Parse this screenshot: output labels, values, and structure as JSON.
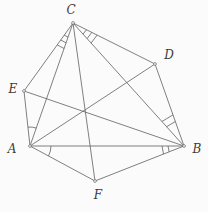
{
  "figure": {
    "background": "#fbfbfb",
    "stroke_color": "#606060",
    "label_color": "#3c3c3c",
    "stroke_width": 0.8,
    "dot_radius": 1.4,
    "points": {
      "A": {
        "x": 30,
        "y": 146,
        "label": "A",
        "label_x": 12,
        "label_y": 149
      },
      "B": {
        "x": 184,
        "y": 146,
        "label": "B",
        "label_x": 197,
        "label_y": 149
      },
      "C": {
        "x": 73,
        "y": 23,
        "label": "C",
        "label_x": 71,
        "label_y": 10
      },
      "D": {
        "x": 155,
        "y": 64,
        "label": "D",
        "label_x": 169,
        "label_y": 55
      },
      "E": {
        "x": 24,
        "y": 91,
        "label": "E",
        "label_x": 13,
        "label_y": 89
      },
      "F": {
        "x": 95,
        "y": 181,
        "label": "F",
        "label_x": 98,
        "label_y": 195
      }
    },
    "segments": [
      [
        "E",
        "C"
      ],
      [
        "C",
        "D"
      ],
      [
        "D",
        "B"
      ],
      [
        "B",
        "F"
      ],
      [
        "F",
        "A"
      ],
      [
        "A",
        "E"
      ],
      [
        "A",
        "B"
      ],
      [
        "B",
        "C"
      ],
      [
        "C",
        "A"
      ],
      [
        "A",
        "D"
      ],
      [
        "B",
        "E"
      ],
      [
        "C",
        "F"
      ]
    ],
    "angle_marks": [
      {
        "vertex": "A",
        "ray1": "E",
        "ray2": "C",
        "style": "arc",
        "radii": [
          19
        ]
      },
      {
        "vertex": "A",
        "ray1": "B",
        "ray2": "F",
        "style": "arc",
        "radii": [
          21
        ]
      },
      {
        "vertex": "B",
        "ray1": "D",
        "ray2": "C",
        "style": "tick",
        "radii": [
          26,
          33
        ]
      },
      {
        "vertex": "B",
        "ray1": "A",
        "ray2": "F",
        "style": "tick",
        "radii": [
          16,
          22
        ]
      },
      {
        "vertex": "C",
        "ray1": "E",
        "ray2": "A",
        "style": "tick",
        "radii": [
          15,
          21,
          27
        ]
      },
      {
        "vertex": "C",
        "ray1": "D",
        "ray2": "B",
        "style": "tick",
        "radii": [
          15,
          21,
          27
        ]
      }
    ]
  }
}
